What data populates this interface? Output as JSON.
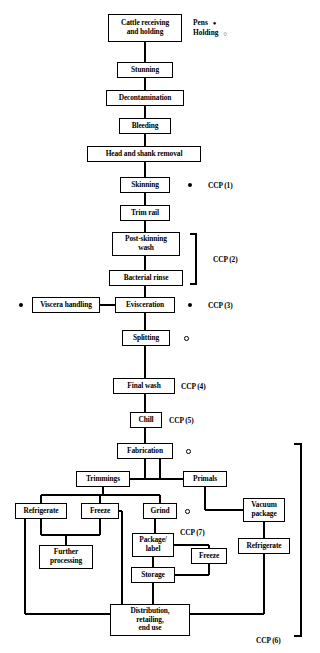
{
  "diagram": {
    "line_color": "#000000",
    "background": "#ffffff"
  },
  "legend": {
    "items": [
      {
        "label": "Pens",
        "marker": "filled-circle-icon",
        "glyph": "●"
      },
      {
        "label": "Holding",
        "marker": "open-circle-icon",
        "glyph": "○"
      }
    ]
  },
  "nodes": [
    {
      "id": "cattle-receiving",
      "label": "Cattle receiving\nand holding",
      "x": 108,
      "y": 14,
      "w": 74,
      "h": 28
    },
    {
      "id": "stunning",
      "label": "Stunning",
      "x": 117,
      "y": 62,
      "w": 56,
      "h": 16
    },
    {
      "id": "decontamination",
      "label": "Decontamination",
      "x": 106,
      "y": 90,
      "w": 78,
      "h": 16
    },
    {
      "id": "bleeding",
      "label": "Bleeding",
      "x": 119,
      "y": 118,
      "w": 52,
      "h": 16
    },
    {
      "id": "head-shank-removal",
      "label": "Head and shank removal",
      "x": 87,
      "y": 146,
      "w": 114,
      "h": 16
    },
    {
      "id": "skinning",
      "label": "Skinning",
      "x": 120,
      "y": 177,
      "w": 50,
      "h": 16
    },
    {
      "id": "trim-rail",
      "label": "Trim rail",
      "x": 120,
      "y": 205,
      "w": 50,
      "h": 16
    },
    {
      "id": "post-skinning-wash",
      "label": "Post-skinning\nwash",
      "x": 112,
      "y": 232,
      "w": 68,
      "h": 24
    },
    {
      "id": "bacterial-rinse",
      "label": "Bacterial rinse",
      "x": 109,
      "y": 270,
      "w": 74,
      "h": 16
    },
    {
      "id": "viscera-handling",
      "label": "Viscera handling",
      "x": 32,
      "y": 297,
      "w": 68,
      "h": 16
    },
    {
      "id": "evisceration",
      "label": "Evisceration",
      "x": 115,
      "y": 297,
      "w": 60,
      "h": 16
    },
    {
      "id": "splitting",
      "label": "Splitting",
      "x": 122,
      "y": 330,
      "w": 48,
      "h": 16
    },
    {
      "id": "final-wash",
      "label": "Final wash",
      "x": 113,
      "y": 378,
      "w": 62,
      "h": 16
    },
    {
      "id": "chill",
      "label": "Chill",
      "x": 130,
      "y": 412,
      "w": 32,
      "h": 16
    },
    {
      "id": "fabrication",
      "label": "Fabrication",
      "x": 117,
      "y": 443,
      "w": 56,
      "h": 16
    },
    {
      "id": "trimmings",
      "label": "Trimmings",
      "x": 76,
      "y": 471,
      "w": 54,
      "h": 16
    },
    {
      "id": "primals",
      "label": "Primals",
      "x": 183,
      "y": 471,
      "w": 44,
      "h": 16
    },
    {
      "id": "refrigerate-left",
      "label": "Refrigerate",
      "x": 15,
      "y": 503,
      "w": 52,
      "h": 16
    },
    {
      "id": "freeze-left",
      "label": "Freeze",
      "x": 81,
      "y": 503,
      "w": 38,
      "h": 16
    },
    {
      "id": "grind",
      "label": "Grind",
      "x": 143,
      "y": 503,
      "w": 34,
      "h": 16
    },
    {
      "id": "vacuum-package",
      "label": "Vacuum\npackage",
      "x": 243,
      "y": 498,
      "w": 42,
      "h": 24
    },
    {
      "id": "package-label",
      "label": "Package/\nlabel",
      "x": 132,
      "y": 533,
      "w": 42,
      "h": 24
    },
    {
      "id": "freeze-right",
      "label": "Freeze",
      "x": 191,
      "y": 548,
      "w": 36,
      "h": 16
    },
    {
      "id": "refrigerate-right",
      "label": "Refrigerate",
      "x": 238,
      "y": 538,
      "w": 52,
      "h": 16
    },
    {
      "id": "further-processing",
      "label": "Further\nprocessing",
      "x": 39,
      "y": 545,
      "w": 54,
      "h": 24
    },
    {
      "id": "storage",
      "label": "Storage",
      "x": 131,
      "y": 567,
      "w": 44,
      "h": 16
    },
    {
      "id": "distribution",
      "label": "Distribution,\nretailing,\nend use",
      "x": 110,
      "y": 604,
      "w": 80,
      "h": 32
    }
  ],
  "ccp_labels": [
    {
      "id": "ccp-1",
      "text": "CCP (1)",
      "x": 208,
      "y": 181
    },
    {
      "id": "ccp-2",
      "text": "CCP (2)",
      "x": 213,
      "y": 255
    },
    {
      "id": "ccp-3",
      "text": "CCP (3)",
      "x": 208,
      "y": 301
    },
    {
      "id": "ccp-4",
      "text": "CCP (4)",
      "x": 181,
      "y": 382
    },
    {
      "id": "ccp-5",
      "text": "CCP (5)",
      "x": 169,
      "y": 416
    },
    {
      "id": "ccp-7",
      "text": "CCP (7)",
      "x": 180,
      "y": 528
    },
    {
      "id": "ccp-6",
      "text": "CCP (6)",
      "x": 256,
      "y": 636
    }
  ],
  "markers": [
    {
      "id": "marker-skinning",
      "type": "filled",
      "x": 188,
      "y": 183
    },
    {
      "id": "marker-viscera",
      "type": "filled",
      "x": 19,
      "y": 303
    },
    {
      "id": "marker-evisceration",
      "type": "filled",
      "x": 188,
      "y": 303
    },
    {
      "id": "marker-splitting",
      "type": "open",
      "x": 184,
      "y": 336
    },
    {
      "id": "marker-fabrication",
      "type": "open",
      "x": 186,
      "y": 449
    },
    {
      "id": "marker-grind",
      "type": "open",
      "x": 185,
      "y": 509
    }
  ],
  "brackets": [
    {
      "id": "ccp2-bracket",
      "x": 196,
      "y_top": 234,
      "y_bottom": 284,
      "arm": 6
    },
    {
      "id": "ccp6-bracket",
      "x": 301,
      "y_top": 444,
      "y_bottom": 636,
      "arm": 7
    }
  ]
}
